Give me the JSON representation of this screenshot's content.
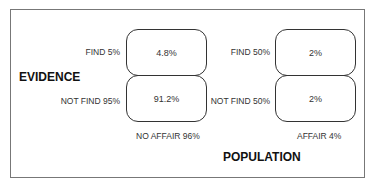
{
  "axes": {
    "evidence_label": "EVIDENCE",
    "population_label": "POPULATION"
  },
  "groups": [
    {
      "label": "NO AFFAIR 96%",
      "rows": [
        {
          "label": "FIND 5%",
          "value": "4.8%"
        },
        {
          "label": "NOT FIND 95%",
          "value": "91.2%"
        }
      ]
    },
    {
      "label": "AFFAIR 4%",
      "rows": [
        {
          "label": "FIND 50%",
          "value": "2%"
        },
        {
          "label": "NOT FIND 50%",
          "value": "2%"
        }
      ]
    }
  ]
}
